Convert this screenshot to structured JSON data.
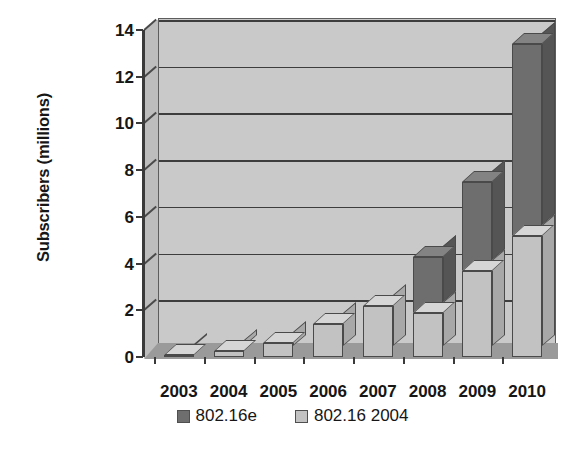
{
  "chart_data": {
    "type": "bar",
    "subtype": "stacked-column-3d",
    "title": "",
    "xlabel": "",
    "ylabel": "Subscribers (millions)",
    "categories": [
      "2003",
      "2004",
      "2005",
      "2006",
      "2007",
      "2008",
      "2009",
      "2010"
    ],
    "series": [
      {
        "name": "802.16 2004",
        "color": "#c2c2c2",
        "values": [
          0.1,
          0.25,
          0.6,
          1.4,
          2.2,
          1.9,
          3.7,
          5.2
        ]
      },
      {
        "name": "802.16e",
        "color": "#6e6e6e",
        "values": [
          0.0,
          0.0,
          0.0,
          0.0,
          0.0,
          2.4,
          3.8,
          8.2
        ]
      }
    ],
    "stack_totals": [
      0.1,
      0.25,
      0.6,
      1.4,
      2.2,
      4.3,
      7.5,
      13.4
    ],
    "ylim": [
      0,
      14
    ],
    "yticks": [
      0,
      2,
      4,
      6,
      8,
      10,
      12,
      14
    ],
    "ytick_labels": [
      "0",
      "2",
      "4",
      "6",
      "8",
      "10",
      "12",
      "14"
    ],
    "grid": true,
    "legend_position": "bottom",
    "legend_entries": [
      {
        "label": "802.16e",
        "swatch": "dark"
      },
      {
        "label": "802.16 2004",
        "swatch": "light"
      }
    ]
  }
}
